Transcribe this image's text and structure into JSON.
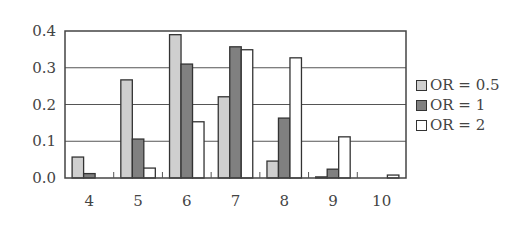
{
  "chart_data": {
    "type": "bar",
    "title": "",
    "xlabel": "",
    "ylabel": "",
    "categories": [
      "4",
      "5",
      "6",
      "7",
      "8",
      "9",
      "10"
    ],
    "series": [
      {
        "name": "OR = 0.5",
        "color": "#cfcfcf",
        "values": [
          0.057,
          0.267,
          0.39,
          0.221,
          0.046,
          0.003,
          0.0
        ]
      },
      {
        "name": "OR = 1",
        "color": "#808080",
        "values": [
          0.012,
          0.106,
          0.31,
          0.357,
          0.163,
          0.024,
          0.0
        ]
      },
      {
        "name": "OR = 2",
        "color": "#ffffff",
        "values": [
          0.0,
          0.027,
          0.153,
          0.349,
          0.327,
          0.112,
          0.008
        ]
      }
    ],
    "ylim": [
      0,
      0.4
    ],
    "yticks": [
      "0.0",
      "0.1",
      "0.2",
      "0.3",
      "0.4"
    ],
    "grid": true,
    "legend_position": "right"
  }
}
